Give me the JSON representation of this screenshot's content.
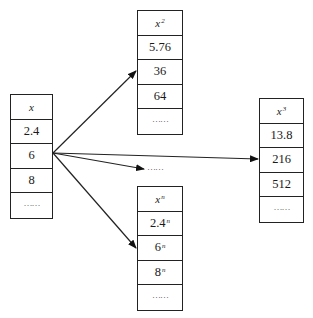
{
  "diagram": {
    "type": "mapping-diagram",
    "source": {
      "header": "x",
      "values": [
        "2.4",
        "6",
        "8",
        "……"
      ]
    },
    "targets": [
      {
        "id": "square",
        "header_base": "x",
        "header_exp": "2",
        "values": [
          {
            "base": "5.76",
            "exp": ""
          },
          {
            "base": "36",
            "exp": ""
          },
          {
            "base": "64",
            "exp": ""
          },
          {
            "base": "……",
            "exp": ""
          }
        ]
      },
      {
        "id": "cube",
        "header_base": "x",
        "header_exp": "3",
        "values": [
          {
            "base": "13.8",
            "exp": ""
          },
          {
            "base": "216",
            "exp": ""
          },
          {
            "base": "512",
            "exp": ""
          },
          {
            "base": "……",
            "exp": ""
          }
        ]
      },
      {
        "id": "nth-power",
        "header_base": "x",
        "header_exp": "n",
        "values": [
          {
            "base": "2.4",
            "exp": "n"
          },
          {
            "base": "6",
            "exp": "n"
          },
          {
            "base": "8",
            "exp": "n"
          },
          {
            "base": "……",
            "exp": ""
          }
        ]
      }
    ],
    "middle_ellipsis": "……",
    "arrow_origin": "6",
    "colors": {
      "line": "#222222",
      "background": "#ffffff"
    }
  }
}
